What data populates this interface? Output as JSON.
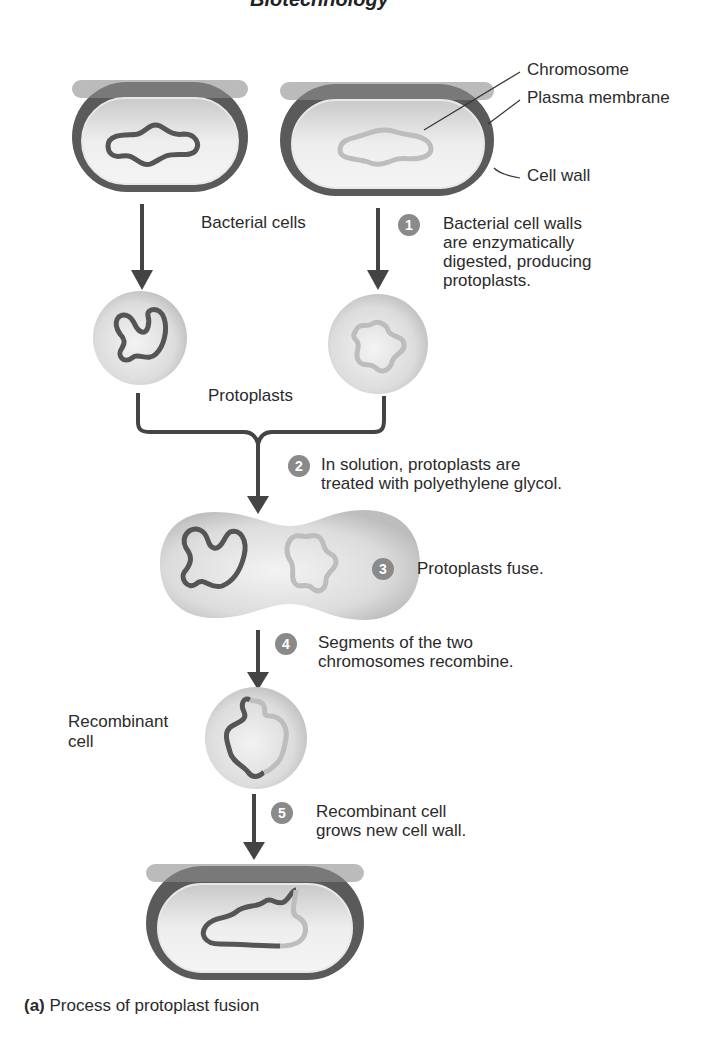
{
  "header_fragment": "Biotechnology",
  "labels": {
    "chromosome": "Chromosome",
    "plasma_membrane": "Plasma membrane",
    "cell_wall": "Cell wall",
    "bacterial_cells": "Bacterial cells",
    "protoplasts": "Protoplasts",
    "recombinant_cell_line1": "Recombinant",
    "recombinant_cell_line2": "cell"
  },
  "steps": [
    {
      "number": "1",
      "lines": [
        "Bacterial cell walls",
        "are enzymatically",
        "digested, producing",
        "protoplasts."
      ]
    },
    {
      "number": "2",
      "lines": [
        "In solution, protoplasts are",
        "treated with polyethylene glycol."
      ]
    },
    {
      "number": "3",
      "lines": [
        "Protoplasts fuse."
      ]
    },
    {
      "number": "4",
      "lines": [
        "Segments of the two",
        "chromosomes recombine."
      ]
    },
    {
      "number": "5",
      "lines": [
        "Recombinant cell",
        "grows new cell wall."
      ]
    }
  ],
  "caption": {
    "prefix": "(a)",
    "text": " Process of protoplast fusion"
  },
  "colors": {
    "cell_wall": "#555555",
    "cytoplasm": "#d8d8d8",
    "chromosome_dark": "#555555",
    "chromosome_light": "#b8b8b8",
    "badge": "#8a8a8a",
    "arrow": "#444444"
  }
}
